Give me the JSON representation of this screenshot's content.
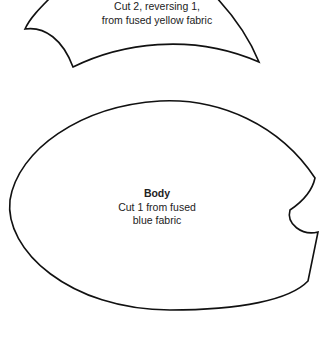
{
  "diagram": {
    "type": "sewing-pattern",
    "line_color": "#111111",
    "background": "#ffffff",
    "pieces": [
      {
        "id": "wing",
        "title": "",
        "lines": [
          "Cut 2, reversing 1,",
          "from fused yellow fabric"
        ]
      },
      {
        "id": "body",
        "title": "Body",
        "lines": [
          "Cut 1 from fused",
          "blue fabric"
        ]
      }
    ]
  }
}
